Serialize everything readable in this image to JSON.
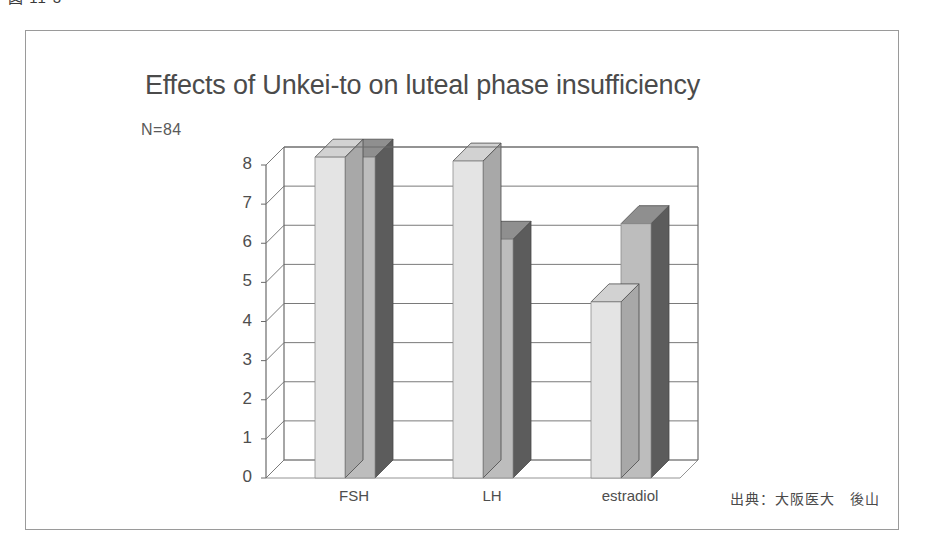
{
  "figure": {
    "caption_fragment": "図 11-3",
    "source_note": "出典：大阪医大　後山"
  },
  "chart_data": {
    "type": "bar",
    "title": "Effects of Unkei-to on luteal phase insufficiency",
    "subtitle": "N=84",
    "xlabel": "",
    "ylabel": "",
    "ylim": [
      0,
      8
    ],
    "ytick_labels": [
      "0",
      "1",
      "2",
      "3",
      "4",
      "5",
      "6",
      "7",
      "8"
    ],
    "yticks": [
      0,
      1,
      2,
      3,
      4,
      5,
      6,
      7,
      8
    ],
    "grid": true,
    "legend": "none",
    "style": "3d-bar",
    "categories": [
      "FSH",
      "LH",
      "estradiol"
    ],
    "series": [
      {
        "name": "Series 1",
        "color": "#e4e4e4",
        "values": [
          8.2,
          8.1,
          4.5
        ]
      },
      {
        "name": "Series 2",
        "color": "#bdbdbd",
        "values": [
          8.2,
          6.1,
          6.5
        ]
      }
    ]
  },
  "colors": {
    "frame": "#9a9a9a",
    "axis": "#6b6b6b",
    "grid": "#7a7a7a",
    "bar_front_light": "#e4e4e4",
    "bar_front_dark": "#bdbdbd",
    "bar_side_light": "#a8a8a8",
    "bar_side_dark": "#5c5c5c",
    "bar_top_light": "#d2d2d2",
    "bar_top_dark": "#8f8f8f",
    "text": "#4e4e4e"
  }
}
